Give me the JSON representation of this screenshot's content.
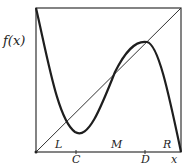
{
  "diagram": {
    "y_axis_label": "f(x)",
    "x_axis_label": "x",
    "frame": {
      "left": 36,
      "top": 8,
      "right": 181,
      "bottom": 152
    },
    "curve_path": "M36,8 C48,60 58,120 75,132 C88,140 100,110 115,72 C125,52 135,40 147,42 C158,44 168,90 181,152",
    "diagonal": {
      "x1": 36,
      "y1": 152,
      "x2": 181,
      "y2": 8
    },
    "points_on_axis": [
      {
        "label": "L",
        "x": 58,
        "y": 147,
        "tick": false
      },
      {
        "label": "C",
        "x": 76,
        "y": 162,
        "tick": true,
        "tick_x": 76
      },
      {
        "label": "M",
        "x": 115,
        "y": 147,
        "tick": false
      },
      {
        "label": "D",
        "x": 145,
        "y": 162,
        "tick": true,
        "tick_x": 145
      },
      {
        "label": "R",
        "x": 166,
        "y": 147,
        "tick": false
      },
      {
        "label": "x",
        "x": 173,
        "y": 162,
        "tick": false
      }
    ],
    "colors": {
      "curve": "#1e1e1e",
      "frame": "#333333",
      "diagonal": "#333333"
    }
  }
}
